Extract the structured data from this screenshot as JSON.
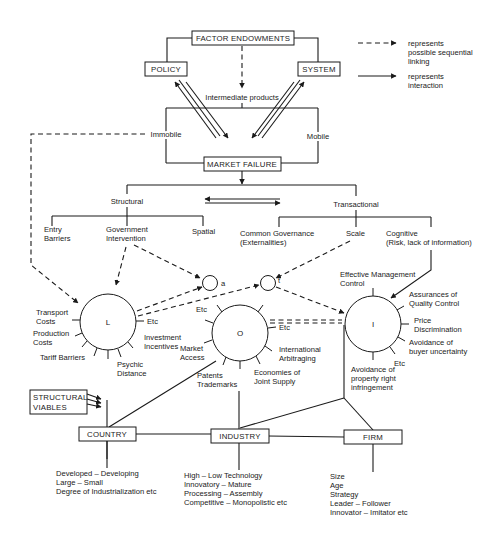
{
  "boxes": {
    "factor_endowments": "FACTOR ENDOWMENTS",
    "policy": "POLICY",
    "system": "SYSTEM",
    "market_failure": "MARKET FAILURE",
    "structural_viables_1": "STRUCTURAL",
    "structural_viables_2": "VIABLES",
    "country": "COUNTRY",
    "industry": "INDUSTRY",
    "firm": "FIRM"
  },
  "legend": {
    "dashed_1": "represents",
    "dashed_2": "possible sequential",
    "dashed_3": "linking",
    "solid_1": "represents",
    "solid_2": "interaction"
  },
  "labels": {
    "intermediate_products": "Intermediate products",
    "immobile": "Immobile",
    "mobile": "Mobile",
    "structural": "Structural",
    "transactional": "Transactional",
    "entry_barriers_1": "Entry",
    "entry_barriers_2": "Barriers",
    "gov_intervention_1": "Government",
    "gov_intervention_2": "Intervention",
    "spatial": "Spatial",
    "common_gov_1": "Common Governance",
    "common_gov_2": "(Externalities)",
    "scale": "Scale",
    "cognitive_1": "Cognitive",
    "cognitive_2": "(Risk, lack of information)",
    "circle_a": "a",
    "circle_t": "t"
  },
  "circles": {
    "L": {
      "label": "L",
      "factors": {
        "transport_1": "Transport",
        "transport_2": "Costs",
        "production_1": "Production",
        "production_2": "Costs",
        "tariff": "Tariff Barriers",
        "psychic_1": "Psychic",
        "psychic_2": "Distance",
        "etc": "Etc",
        "investment_1": "Investment",
        "investment_2": "Incentives"
      }
    },
    "O": {
      "label": "O",
      "factors": {
        "etc_top": "Etc",
        "etc_right": "Etc",
        "market_1": "Market",
        "market_2": "Access",
        "patents_1": "Patents",
        "patents_2": "Trademarks",
        "economies_1": "Economies of",
        "economies_2": "Joint Supply",
        "arbitrage_1": "International",
        "arbitrage_2": "Arbitraging"
      }
    },
    "I": {
      "label": "I",
      "factors": {
        "mgmt_1": "Effective Management",
        "mgmt_2": "Control",
        "quality_1": "Assurances of",
        "quality_2": "Quality Control",
        "price_1": "Price",
        "price_2": "Discrimination",
        "buyer_1": "Avoidance of",
        "buyer_2": "buyer uncertainty",
        "etc": "Etc",
        "property_1": "Avoidance of",
        "property_2": "property right",
        "property_3": "infringement"
      }
    }
  },
  "levels": {
    "country": [
      "Developed – Developing",
      "Large – Small",
      "Degree of Industrialization etc"
    ],
    "industry": [
      "High – Low Technology",
      "Innovatory – Mature",
      "Processing – Assembly",
      "Competitive – Monopolistic etc"
    ],
    "firm": [
      "Size",
      "Age",
      "Strategy",
      "Leader – Follower",
      "Innovator – Imitator etc"
    ]
  }
}
